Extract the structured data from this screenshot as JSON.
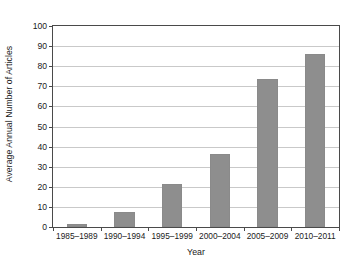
{
  "chart_data": {
    "type": "bar",
    "title": "",
    "xlabel": "Year",
    "ylabel": "Average Annual Number of Articles",
    "categories": [
      "1985–1989",
      "1990–1994",
      "1995–1999",
      "2000–2004",
      "2005–2009",
      "2010–2011"
    ],
    "values": [
      1.7,
      7.5,
      21.5,
      36.5,
      73.5,
      86
    ],
    "ylim": [
      0,
      100
    ],
    "yticks": [
      0,
      10,
      20,
      30,
      40,
      50,
      60,
      70,
      80,
      90,
      100
    ],
    "ytick_labels": [
      "0",
      "10",
      "20",
      "30",
      "40",
      "50",
      "60",
      "70",
      "80",
      "90",
      "100"
    ],
    "grid": "horizontal",
    "legend": "none",
    "bar_color": "#8e8e8e",
    "gridline_color": "#c9c9c9",
    "axis_color": "#4a4a4a",
    "background_color": "#ffffff"
  }
}
